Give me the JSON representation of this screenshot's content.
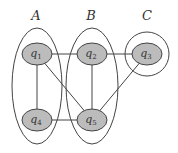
{
  "diagram": {
    "colors": {
      "node_fill": "#bcbcbc",
      "stroke": "#444444",
      "background": "#ffffff"
    },
    "groups": [
      {
        "id": "A",
        "label": "A",
        "cx": 37,
        "cy": 86,
        "rx": 25,
        "ry": 58,
        "label_x": 36,
        "label_y": 20,
        "shape": "ellipse"
      },
      {
        "id": "B",
        "label": "B",
        "cx": 92,
        "cy": 86,
        "rx": 26,
        "ry": 58,
        "label_x": 91,
        "label_y": 20,
        "shape": "ellipse"
      },
      {
        "id": "C",
        "label": "C",
        "cx": 147,
        "cy": 54,
        "rx": 22,
        "ry": 22,
        "label_x": 147,
        "label_y": 20,
        "shape": "circle"
      }
    ],
    "nodes": [
      {
        "id": "q1",
        "base": "q",
        "sub": "1",
        "cx": 37,
        "cy": 54
      },
      {
        "id": "q2",
        "base": "q",
        "sub": "2",
        "cx": 92,
        "cy": 54
      },
      {
        "id": "q3",
        "base": "q",
        "sub": "3",
        "cx": 147,
        "cy": 54
      },
      {
        "id": "q4",
        "base": "q",
        "sub": "4",
        "cx": 37,
        "cy": 120
      },
      {
        "id": "q5",
        "base": "q",
        "sub": "5",
        "cx": 92,
        "cy": 120
      }
    ],
    "edges": [
      [
        "q1",
        "q2"
      ],
      [
        "q2",
        "q3"
      ],
      [
        "q1",
        "q4"
      ],
      [
        "q1",
        "q5"
      ],
      [
        "q2",
        "q5"
      ],
      [
        "q3",
        "q5"
      ],
      [
        "q4",
        "q5"
      ]
    ]
  }
}
